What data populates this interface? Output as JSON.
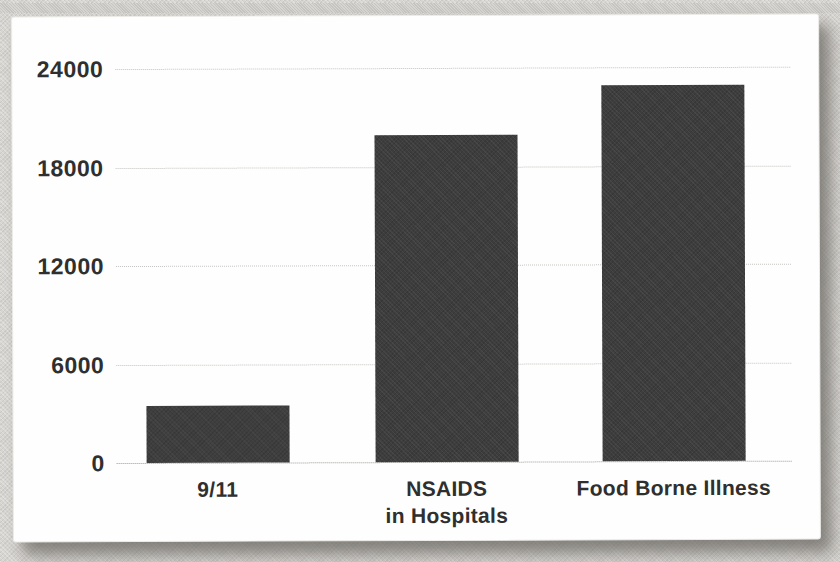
{
  "page": {
    "background_color": "#d7d5d1",
    "card_color": "#fefefe"
  },
  "chart_data": {
    "type": "bar",
    "title": "",
    "xlabel": "",
    "ylabel": "",
    "categories": [
      "9/11",
      "NSAIDS\nin Hospitals",
      "Food Borne Illness"
    ],
    "values": [
      3500,
      19900,
      22900
    ],
    "ylim": [
      0,
      24000
    ],
    "yticks": [
      0,
      6000,
      12000,
      18000,
      24000
    ],
    "ytick_labels": [
      "0",
      "6000",
      "12000",
      "18000",
      "24000"
    ],
    "grid": true,
    "gridline_color": "#c3c3c1",
    "legend": false,
    "bar_color": "#3d3d3d",
    "label_color": "#2f2f2f"
  }
}
